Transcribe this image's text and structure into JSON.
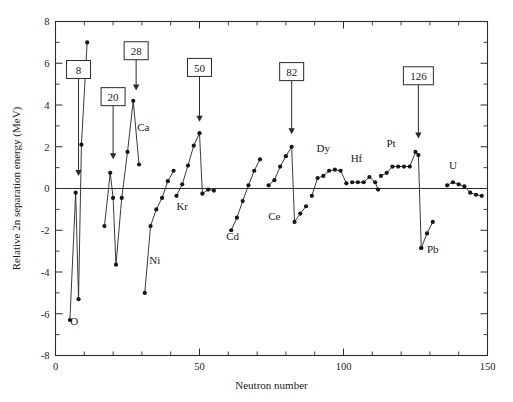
{
  "chart_data": {
    "type": "line",
    "title": "",
    "xlabel": "Neutron number",
    "ylabel": "Relative 2n separation energy (MeV)",
    "xlim": [
      0,
      150
    ],
    "ylim": [
      -8,
      8
    ],
    "xticks": [
      0,
      50,
      100,
      150
    ],
    "yticks": [
      -8,
      -6,
      -4,
      -2,
      0,
      2,
      4,
      6,
      8
    ],
    "xtick_labels": [
      "0",
      "50",
      "100",
      "150"
    ],
    "ytick_labels": [
      "-8",
      "-6",
      "-4",
      "-2",
      "0",
      "2",
      "4",
      "6",
      "8"
    ],
    "x_minor_step": 10,
    "y_minor_step": 1,
    "grid": false,
    "legend": "none",
    "zero_reference_line": 0,
    "series": [
      {
        "name": "isotopic-chain-O",
        "points": [
          [
            5.0,
            -6.3
          ],
          [
            7.0,
            -0.2
          ],
          [
            8.0,
            -5.3
          ],
          [
            9.0,
            2.1
          ],
          [
            11.0,
            7.0
          ]
        ]
      },
      {
        "name": "isotopic-chain-Ca",
        "points": [
          [
            17.0,
            -1.8
          ],
          [
            19.0,
            0.75
          ],
          [
            20.0,
            -0.45
          ],
          [
            21.0,
            -3.65
          ],
          [
            23.0,
            -0.45
          ],
          [
            25.0,
            1.75
          ],
          [
            27.0,
            4.2
          ],
          [
            29.0,
            1.15
          ]
        ]
      },
      {
        "name": "isotopic-chain-Ni",
        "points": [
          [
            31.0,
            -5.0
          ],
          [
            33.0,
            -1.8
          ],
          [
            35.0,
            -1.0
          ],
          [
            37.0,
            -0.45
          ],
          [
            39.0,
            0.35
          ],
          [
            41.0,
            0.85
          ]
        ]
      },
      {
        "name": "isotopic-chain-Kr",
        "points": [
          [
            42.0,
            -0.35
          ],
          [
            44.0,
            0.2
          ],
          [
            46.0,
            1.1
          ],
          [
            48.0,
            2.05
          ],
          [
            50.0,
            2.65
          ],
          [
            51.0,
            -0.25
          ],
          [
            53.0,
            -0.05
          ],
          [
            55.0,
            -0.1
          ]
        ]
      },
      {
        "name": "isotopic-chain-Cd",
        "points": [
          [
            61.0,
            -2.0
          ],
          [
            63.0,
            -1.4
          ],
          [
            65.0,
            -0.6
          ],
          [
            67.0,
            0.15
          ],
          [
            69.0,
            0.85
          ],
          [
            71.0,
            1.4
          ]
        ]
      },
      {
        "name": "isotopic-chain-Ce",
        "points": [
          [
            74.0,
            0.15
          ],
          [
            76.0,
            0.4
          ],
          [
            78.0,
            1.05
          ],
          [
            80.0,
            1.55
          ],
          [
            82.0,
            2.0
          ],
          [
            83.0,
            -1.6
          ],
          [
            85.0,
            -1.2
          ],
          [
            87.0,
            -0.85
          ]
        ]
      },
      {
        "name": "isotopic-chain-Dy",
        "points": [
          [
            89.0,
            -0.35
          ],
          [
            91.0,
            0.5
          ],
          [
            93.0,
            0.6
          ],
          [
            95.0,
            0.85
          ],
          [
            97.0,
            0.9
          ],
          [
            99.0,
            0.85
          ],
          [
            101.0,
            0.25
          ]
        ]
      },
      {
        "name": "isotopic-chain-Hf",
        "points": [
          [
            103.0,
            0.3
          ],
          [
            105.0,
            0.3
          ],
          [
            107.0,
            0.3
          ],
          [
            109.0,
            0.55
          ],
          [
            111.0,
            0.3
          ],
          [
            112.0,
            -0.05
          ]
        ]
      },
      {
        "name": "isotopic-chain-Pt",
        "points": [
          [
            113.0,
            0.6
          ],
          [
            115.0,
            0.75
          ],
          [
            117.0,
            1.05
          ],
          [
            119.0,
            1.05
          ],
          [
            121.0,
            1.05
          ],
          [
            123.0,
            1.05
          ],
          [
            125.0,
            1.75
          ],
          [
            126.0,
            1.6
          ],
          [
            127.0,
            -2.85
          ]
        ]
      },
      {
        "name": "isotopic-chain-Pb",
        "points": [
          [
            127.0,
            -2.85
          ],
          [
            129.0,
            -2.15
          ],
          [
            131.0,
            -1.6
          ]
        ]
      },
      {
        "name": "isotopic-chain-U",
        "points": [
          [
            136.0,
            0.15
          ],
          [
            138.0,
            0.3
          ],
          [
            140.0,
            0.2
          ],
          [
            142.0,
            0.1
          ],
          [
            144.0,
            -0.2
          ],
          [
            146.0,
            -0.3
          ],
          [
            148.0,
            -0.35
          ]
        ]
      }
    ],
    "element_labels": [
      {
        "text": "O",
        "x": 6.5,
        "y": -6.55
      },
      {
        "text": "Ca",
        "x": 30.5,
        "y": 2.75
      },
      {
        "text": "Ni",
        "x": 34.5,
        "y": -3.6
      },
      {
        "text": "Kr",
        "x": 44.0,
        "y": -1.05
      },
      {
        "text": "Cd",
        "x": 61.5,
        "y": -2.45
      },
      {
        "text": "Ce",
        "x": 76.0,
        "y": -1.5
      },
      {
        "text": "Dy",
        "x": 93.0,
        "y": 1.75
      },
      {
        "text": "Hf",
        "x": 104.5,
        "y": 1.25
      },
      {
        "text": "Pt",
        "x": 116.5,
        "y": 2.0
      },
      {
        "text": "Pb",
        "x": 131.0,
        "y": -3.1
      },
      {
        "text": "U",
        "x": 138.0,
        "y": 0.95
      }
    ],
    "magic_numbers": [
      {
        "label": "8",
        "x": 8,
        "box_y": 5.7,
        "arrow_tip_y": 0.6
      },
      {
        "label": "20",
        "x": 20,
        "box_y": 4.4,
        "arrow_tip_y": 1.4
      },
      {
        "label": "28",
        "x": 28,
        "box_y": 6.6,
        "arrow_tip_y": 4.7
      },
      {
        "label": "50",
        "x": 50,
        "box_y": 5.8,
        "arrow_tip_y": 3.2
      },
      {
        "label": "82",
        "x": 82,
        "box_y": 5.6,
        "arrow_tip_y": 2.6
      },
      {
        "label": "126",
        "x": 126,
        "box_y": 5.4,
        "arrow_tip_y": 2.4
      }
    ]
  }
}
